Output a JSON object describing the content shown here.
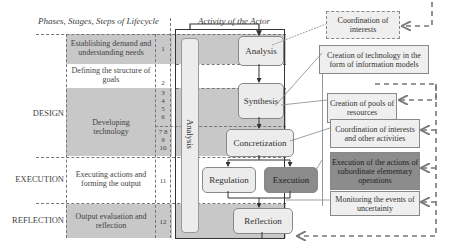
{
  "headers": {
    "left": "Phases, Stages, Steps of Lifecycle",
    "middle": "Activity of the Actor"
  },
  "phases": [
    {
      "label": "DESIGN"
    },
    {
      "label": "EXECUTION"
    },
    {
      "label": "REFLECTION"
    }
  ],
  "stages": [
    {
      "label": "Establishing demand and understanding needs",
      "steps": "1",
      "shaded": true
    },
    {
      "label": "Defining the structure of goals",
      "steps": "2",
      "shaded": false
    },
    {
      "label": "Developing technology",
      "steps_a": "3 4 5 6",
      "steps_b": "7 8 9 10",
      "shaded": true
    },
    {
      "label": "Executing actions and forming the output",
      "steps": "11",
      "shaded": false
    },
    {
      "label": "Output evaluation and reflection",
      "steps": "12",
      "shaded": true
    }
  ],
  "analysis_bar": "Analysis",
  "activities": {
    "analysis": "Analysis",
    "synthesis": "Synthesis",
    "concretization": "Concretization",
    "regulation": "Regulation",
    "execution": "Execution",
    "reflection": "Reflection"
  },
  "outcomes": [
    {
      "label": "Coordination of interests",
      "style": "dashed"
    },
    {
      "label": "Creation of technology in the form of information models",
      "style": "plain"
    },
    {
      "label": "Creation of pools of resources",
      "style": "plain"
    },
    {
      "label": "Coordination of interests and other activities",
      "style": "plain"
    },
    {
      "label": "Execution of the actions of subordinate elementary operations",
      "style": "dark"
    },
    {
      "label": "Monitoring the events of uncertainty",
      "style": "plain"
    }
  ],
  "colors": {
    "band_shade": "#c8c8c8",
    "box_light": "#ececec",
    "box_dark": "#8c8c8c",
    "arrow_dashed": "#777777"
  }
}
